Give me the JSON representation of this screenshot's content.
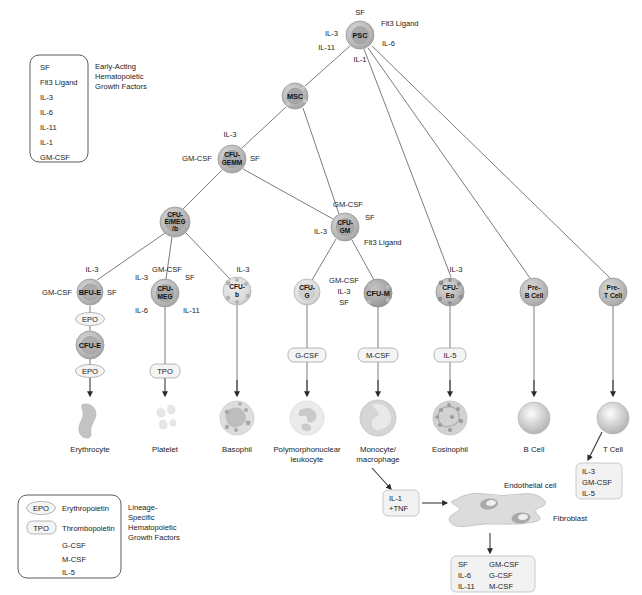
{
  "figure": {
    "colors": {
      "node_fill": "#b9b9b9",
      "node_stroke": "#8f8f8f",
      "edge": "#5a5a5a",
      "box_stroke": "#4a4a4a",
      "pill_fill": "#f4f4f4",
      "text": "#1b1b1b"
    }
  },
  "legend_top": {
    "name": "early-acting-legend",
    "caption": [
      "Early-Acting",
      "Hematopoietic",
      "Growth Factors"
    ],
    "items": [
      "SF",
      "Flt3 Ligand",
      "IL-3",
      "IL-6",
      "IL-11",
      "IL-1",
      "GM-CSF"
    ]
  },
  "legend_bottom": {
    "name": "lineage-specific-legend",
    "caption": [
      "Lineage-",
      "Specific",
      "Hematopoietic",
      "Growth Factors"
    ],
    "items": [
      {
        "abbr": "EPO",
        "full": "Erythropoietin",
        "shape": "oval"
      },
      {
        "abbr": "TPO",
        "full": "Thrombopoietin",
        "shape": "rounded"
      },
      {
        "abbr": "G-CSF",
        "full": "",
        "shape": "none"
      },
      {
        "abbr": "M-CSF",
        "full": "",
        "shape": "none"
      },
      {
        "abbr": "IL-5",
        "full": "",
        "shape": "none"
      }
    ]
  },
  "nodes": {
    "psc": {
      "label": "PSC",
      "x": 360,
      "y": 35,
      "r": 14
    },
    "msc": {
      "label": "MSC",
      "x": 295,
      "y": 96,
      "r": 13
    },
    "cfu_gemm": {
      "label": [
        "CFU-",
        "GEMM"
      ],
      "x": 232,
      "y": 159,
      "r": 14
    },
    "cfu_emeg": {
      "label": [
        "CFU-",
        "E/MEG",
        "/b"
      ],
      "x": 175,
      "y": 222,
      "r": 15
    },
    "cfu_gm": {
      "label": [
        "CFU-",
        "GM"
      ],
      "x": 345,
      "y": 227,
      "r": 14
    },
    "bfu_e": {
      "label": "BFU-E",
      "x": 90,
      "y": 292,
      "r": 13
    },
    "cfu_meg": {
      "label": [
        "CFU-",
        "MEG"
      ],
      "x": 165,
      "y": 293,
      "r": 14
    },
    "cfu_b": {
      "label": [
        "CFU-",
        "b"
      ],
      "x": 237,
      "y": 291,
      "r": 14
    },
    "cfu_g": {
      "label": [
        "CFU-",
        "G"
      ],
      "x": 307,
      "y": 292,
      "r": 13
    },
    "cfu_m": {
      "label": "CFU-M",
      "x": 378,
      "y": 293,
      "r": 14
    },
    "cfu_eo": {
      "label": [
        "CFU-",
        "Eo"
      ],
      "x": 450,
      "y": 292,
      "r": 14
    },
    "pre_b": {
      "label": [
        "Pre-",
        "B Cell"
      ],
      "x": 534,
      "y": 292,
      "r": 14
    },
    "pre_t": {
      "label": [
        "Pre-",
        "T Cell"
      ],
      "x": 613,
      "y": 292,
      "r": 14
    },
    "cfu_e": {
      "label": "CFU-E",
      "x": 90,
      "y": 345,
      "r": 14
    }
  },
  "edge_labels": {
    "psc": [
      "SF",
      "Flt3 Ligand",
      "IL-3",
      "IL-6",
      "IL-11",
      "IL-1"
    ],
    "cfu_gemm": [
      "IL-3",
      "GM-CSF",
      "SF"
    ],
    "cfu_gm": [
      "GM-CSF",
      "SF",
      "IL-3",
      "Flt3 Ligand"
    ],
    "bfu_e": [
      "IL-3",
      "GM-CSF",
      "SF"
    ],
    "cfu_meg": [
      "GM-CSF",
      "IL-3",
      "SF",
      "IL-6",
      "IL-11"
    ],
    "cfu_b": [
      "IL-3"
    ],
    "cfu_m": [
      "GM-CSF",
      "IL-3",
      "SF"
    ],
    "cfu_eo": [
      "IL-3"
    ]
  },
  "pills": [
    {
      "name": "pill-epo-upper",
      "text": "EPO",
      "x": 90,
      "y": 319
    },
    {
      "name": "pill-epo-lower",
      "text": "EPO",
      "x": 90,
      "y": 371
    },
    {
      "name": "pill-tpo",
      "text": "TPO",
      "x": 165,
      "y": 371
    },
    {
      "name": "pill-gcsf",
      "text": "G-CSF",
      "x": 307,
      "y": 355
    },
    {
      "name": "pill-mcsf",
      "text": "M-CSF",
      "x": 378,
      "y": 355
    },
    {
      "name": "pill-il5",
      "text": "IL-5",
      "x": 450,
      "y": 355
    }
  ],
  "mature_cells": [
    {
      "name": "erythrocyte",
      "label": [
        "Erythrocyte"
      ],
      "x": 90,
      "y": 418,
      "type": "erythrocyte"
    },
    {
      "name": "platelet",
      "label": [
        "Platelet"
      ],
      "x": 165,
      "y": 418,
      "type": "platelet"
    },
    {
      "name": "basophil",
      "label": [
        "Basophil"
      ],
      "x": 237,
      "y": 418,
      "type": "granulocyte"
    },
    {
      "name": "polymorphonuclear-leukocyte",
      "label": [
        "Polymorphonuclear",
        "leukocyte"
      ],
      "x": 307,
      "y": 418,
      "type": "pmn"
    },
    {
      "name": "monocyte-macrophage",
      "label": [
        "Monocyte/",
        "macrophage"
      ],
      "x": 378,
      "y": 418,
      "type": "monocyte"
    },
    {
      "name": "eosinophil",
      "label": [
        "Eosinophil"
      ],
      "x": 450,
      "y": 418,
      "type": "eosinophil"
    },
    {
      "name": "b-cell",
      "label": [
        "B Cell"
      ],
      "x": 534,
      "y": 418,
      "type": "lymphocyte"
    },
    {
      "name": "t-cell",
      "label": [
        "T Cell"
      ],
      "x": 613,
      "y": 418,
      "type": "lymphocyte"
    }
  ],
  "t_cell_output": {
    "name": "t-cell-cytokine-box",
    "items": [
      "IL-3",
      "GM-CSF",
      "IL-5"
    ]
  },
  "il1_tnf_box": {
    "name": "il1-tnf-box",
    "items": [
      "IL-1",
      "+TNF"
    ]
  },
  "stroma": {
    "endothelial_label": "Endothelial cell",
    "fibroblast_label": "Fibroblast"
  },
  "stroma_output": {
    "name": "stromal-cytokine-box",
    "col1": [
      "SF",
      "IL-6",
      "IL-11"
    ],
    "col2": [
      "GM-CSF",
      "G-CSF",
      "M-CSF"
    ]
  }
}
